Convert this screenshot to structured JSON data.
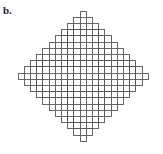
{
  "figure": {
    "label": "b.",
    "caption": ""
  },
  "chart_data": {
    "type": "diagram",
    "title": "",
    "xlabel": "",
    "ylabel": "",
    "shape": "stepped-diamond",
    "unit_cell_px": 6.2,
    "rows": 21,
    "row_widths": [
      1,
      3,
      5,
      7,
      9,
      11,
      13,
      15,
      17,
      19,
      21,
      19,
      17,
      15,
      13,
      11,
      9,
      7,
      5,
      3,
      1
    ],
    "total_cells": 221,
    "max_width_cells": 21,
    "max_height_cells": 21,
    "origin_x_px": 18,
    "origin_y_px": 11,
    "line_color": "#555555",
    "fill_color": "#ffffff",
    "background_color": "#ffffff",
    "line_width_px": 0.9,
    "grid": "on",
    "legend_position": "none"
  }
}
